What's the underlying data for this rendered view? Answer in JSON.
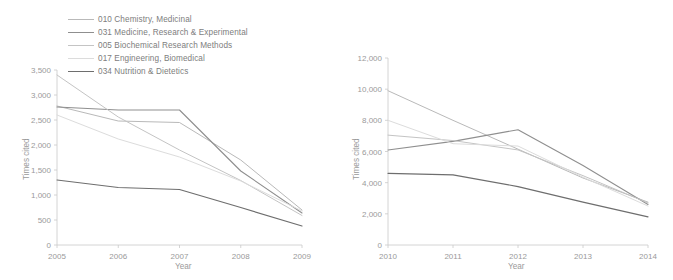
{
  "legend": {
    "items": [
      {
        "label": "010 Chemistry, Medicinal",
        "color": "#b9b9b9"
      },
      {
        "label": "031 Medicine, Research & Experimental",
        "color": "#8f8f8f"
      },
      {
        "label": "005 Biochemical Research Methods",
        "color": "#c4c4c4"
      },
      {
        "label": "017 Engineering, Biomedical",
        "color": "#dcdcdc"
      },
      {
        "label": "034 Nutrition & Dietetics",
        "color": "#6e6e6e"
      }
    ]
  },
  "chart_data": [
    {
      "type": "line",
      "id": "left-chart",
      "title": "",
      "xlabel": "Year",
      "ylabel": "Times cited",
      "categories": [
        "2005",
        "2006",
        "2007",
        "2008",
        "2009"
      ],
      "x": [
        2005,
        2006,
        2007,
        2008,
        2009
      ],
      "xlim": [
        2005,
        2009
      ],
      "ylim": [
        0,
        3500
      ],
      "yticks": [
        0,
        500,
        1000,
        1500,
        2000,
        2500,
        3000,
        3500
      ],
      "ytick_labels": [
        "0",
        "500",
        "1,000",
        "1,500",
        "2,000",
        "2,500",
        "3,000",
        "3,500"
      ],
      "grid": false,
      "legend_position": "above-left",
      "series": [
        {
          "name": "010 Chemistry, Medicinal",
          "color": "#b9b9b9",
          "width": 1.0,
          "values": [
            2780,
            2480,
            2450,
            1700,
            700
          ]
        },
        {
          "name": "031 Medicine, Research & Experimental",
          "color": "#8f8f8f",
          "width": 1.1,
          "values": [
            2760,
            2700,
            2700,
            1480,
            640
          ]
        },
        {
          "name": "005 Biochemical Research Methods",
          "color": "#c4c4c4",
          "width": 1.0,
          "values": [
            3400,
            2560,
            1900,
            1290,
            590
          ]
        },
        {
          "name": "017 Engineering, Biomedical",
          "color": "#dcdcdc",
          "width": 1.0,
          "values": [
            2600,
            2120,
            1760,
            1280,
            680
          ]
        },
        {
          "name": "034 Nutrition & Dietetics",
          "color": "#6e6e6e",
          "width": 1.2,
          "values": [
            1300,
            1150,
            1110,
            750,
            380
          ]
        }
      ]
    },
    {
      "type": "line",
      "id": "right-chart",
      "title": "",
      "xlabel": "Year",
      "ylabel": "Times cited",
      "categories": [
        "2010",
        "2011",
        "2012",
        "2013",
        "2014"
      ],
      "x": [
        2010,
        2011,
        2012,
        2013,
        2014
      ],
      "xlim": [
        2010,
        2014
      ],
      "ylim": [
        0,
        12000
      ],
      "yticks": [
        0,
        2000,
        4000,
        6000,
        8000,
        10000,
        12000
      ],
      "ytick_labels": [
        "0",
        "2,000",
        "4,000",
        "6,000",
        "8,000",
        "10,000",
        "12,000"
      ],
      "grid": false,
      "legend_position": "none",
      "series": [
        {
          "name": "010 Chemistry, Medicinal",
          "color": "#b9b9b9",
          "width": 1.0,
          "values": [
            9900,
            8000,
            6150,
            4300,
            2750
          ]
        },
        {
          "name": "031 Medicine, Research & Experimental",
          "color": "#8f8f8f",
          "width": 1.1,
          "values": [
            6100,
            6650,
            7400,
            5100,
            2600
          ]
        },
        {
          "name": "005 Biochemical Research Methods",
          "color": "#c4c4c4",
          "width": 1.0,
          "values": [
            7050,
            6700,
            6100,
            4450,
            2700
          ]
        },
        {
          "name": "017 Engineering, Biomedical",
          "color": "#dcdcdc",
          "width": 1.0,
          "values": [
            8000,
            6500,
            6350,
            4350,
            2500
          ]
        },
        {
          "name": "034 Nutrition & Dietetics",
          "color": "#6e6e6e",
          "width": 1.2,
          "values": [
            4600,
            4500,
            3750,
            2750,
            1800
          ]
        }
      ]
    }
  ]
}
